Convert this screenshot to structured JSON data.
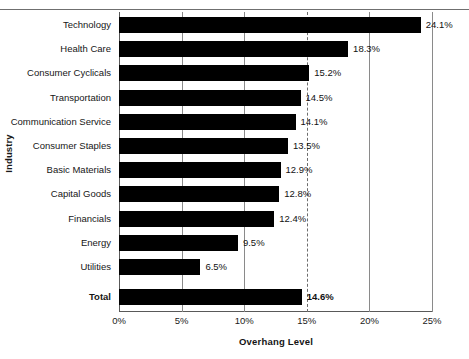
{
  "chart_data": {
    "type": "bar",
    "orientation": "horizontal",
    "title": "",
    "xlabel": "Overhang Level",
    "ylabel": "Industry",
    "xlim": [
      0,
      25
    ],
    "xtick_labels": [
      "0%",
      "5%",
      "10%",
      "15%",
      "20%",
      "25%"
    ],
    "xtick_values": [
      0,
      5,
      10,
      15,
      20,
      25
    ],
    "grid": "vertical",
    "gridline_styles": [
      "none",
      "solid",
      "solid",
      "dashed",
      "solid",
      "solid"
    ],
    "legend": "none",
    "bar_color": "#000000",
    "categories": [
      "Technology",
      "Health Care",
      "Consumer Cyclicals",
      "Transportation",
      "Communication Service",
      "Consumer Staples",
      "Basic Materials",
      "Capital Goods",
      "Financials",
      "Energy",
      "Utilities",
      "Total"
    ],
    "values": [
      24.1,
      18.3,
      15.2,
      14.5,
      14.1,
      13.5,
      12.9,
      12.8,
      12.4,
      9.5,
      6.5,
      14.6
    ],
    "value_labels": [
      "24.1%",
      "18.3%",
      "15.2%",
      "14.5%",
      "14.1%",
      "13.5%",
      "12.9%",
      "12.8%",
      "12.4%",
      "9.5%",
      "6.5%",
      "14.6%"
    ],
    "emphasized": [
      false,
      false,
      false,
      false,
      false,
      false,
      false,
      false,
      false,
      false,
      false,
      true
    ]
  },
  "axes": {
    "x_title": "Overhang Level",
    "y_title": "Industry"
  }
}
